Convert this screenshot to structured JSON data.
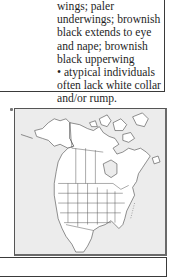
{
  "description": {
    "lines": [
      "wings; paler",
      "underwings; brownish",
      "black extends to eye",
      "and nape; brownish",
      "black upperwing",
      "• atypical individuals",
      "often lack white collar",
      "and/or rump."
    ]
  },
  "map": {
    "label": "range-map-north-america",
    "background_color": "#ececec",
    "land_color": "#ffffff",
    "border_color": "#555555"
  }
}
